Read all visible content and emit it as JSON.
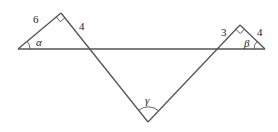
{
  "diagram": {
    "type": "geometry-triangles",
    "left_triangle": {
      "side_hypotenuse_adjacent_label": "6",
      "side_right_label": "4",
      "angle_label": "α",
      "right_angle_at": "apex"
    },
    "right_triangle": {
      "side_left_label": "3",
      "side_right_label": "4",
      "angle_label": "β",
      "right_angle_at": "apex"
    },
    "bottom_angle_label": "γ"
  }
}
